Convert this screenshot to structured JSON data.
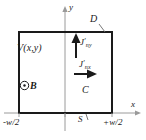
{
  "figure": {
    "type": "physics-diagram",
    "axes": {
      "x_label": "x",
      "y_label": "y",
      "x_tick_left": "-w/2",
      "x_tick_right": "+w/2",
      "x_tick_mid": "S"
    },
    "labels": {
      "potential": "V(x,y)",
      "magnetic_field_symbol": "⊙",
      "magnetic_field": "B",
      "boundary_top": "D",
      "region": "C",
      "current_y_base": "J",
      "current_y_sub": "ny",
      "current_x_base": "J",
      "current_x_sub": "nx",
      "prime": "′"
    },
    "colors": {
      "stroke": "#1a1a1a",
      "axis": "#9a9a9a",
      "background": "#ffffff"
    },
    "geometry": {
      "rect_left_px": 19,
      "rect_top_px": 32,
      "rect_right_px": 112,
      "rect_bottom_px": 113,
      "y_axis_x_px": 65,
      "x_axis_y_px": 113
    }
  }
}
